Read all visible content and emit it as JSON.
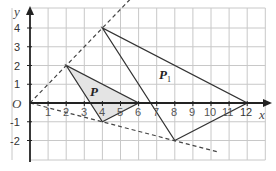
{
  "diagram": {
    "type": "enlargement-on-grid",
    "axes": {
      "x_label": "x",
      "y_label": "y",
      "origin_label": "O",
      "x_ticks": [
        "1",
        "2",
        "3",
        "4",
        "5",
        "6",
        "7",
        "8",
        "9",
        "10",
        "11",
        "12"
      ],
      "y_ticks_positive": [
        "1",
        "2",
        "3",
        "4"
      ],
      "y_ticks_negative": [
        "-1",
        "-2"
      ]
    },
    "shapes": {
      "P": {
        "label": "P",
        "vertices": [
          [
            2,
            2
          ],
          [
            4,
            -1
          ],
          [
            6,
            0
          ]
        ],
        "fill": "#e4e4e4"
      },
      "P1": {
        "label": "P",
        "subscript": "1",
        "vertices": [
          [
            4,
            4
          ],
          [
            8,
            -2
          ],
          [
            12,
            0
          ]
        ]
      }
    },
    "construction_lines": [
      {
        "style": "dashed",
        "from": [
          0,
          0
        ],
        "to": [
          6,
          6
        ],
        "through": [
          [
            2,
            2
          ],
          [
            4,
            4
          ]
        ]
      },
      {
        "style": "dashed",
        "from": [
          0,
          0
        ],
        "to": [
          11,
          -2.75
        ],
        "through": [
          [
            4,
            -1
          ],
          [
            8,
            -2
          ]
        ]
      }
    ],
    "colors": {
      "grid": "#c8c8c8",
      "axis": "#222222",
      "line": "#333333"
    }
  }
}
